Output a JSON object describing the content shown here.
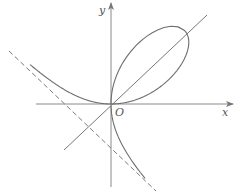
{
  "figure": {
    "labels": {
      "x_axis": "x",
      "y_axis": "y",
      "origin": "O"
    },
    "colors": {
      "curve": "#6e6e6e",
      "axes": "#8a8a8a",
      "asymptote": "#7a7a7a",
      "background": "#ffffff"
    },
    "elements": [
      {
        "name": "x-axis",
        "type": "arrow-line"
      },
      {
        "name": "y-axis",
        "type": "arrow-line"
      },
      {
        "name": "folium-curve",
        "type": "curve",
        "equation": "x^3 + y^3 = 3axy"
      },
      {
        "name": "symmetry-line",
        "type": "line",
        "equation": "y = x"
      },
      {
        "name": "asymptote",
        "type": "dashed-line",
        "equation": "x + y + a = 0"
      }
    ]
  }
}
